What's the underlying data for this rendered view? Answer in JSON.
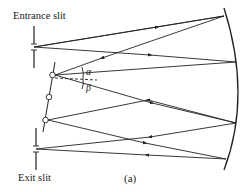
{
  "diagram": {
    "type": "Czerny-Turner monochromator optical layout",
    "labels": {
      "entrance_slit": "Entrance slit",
      "exit_slit": "Exit slit",
      "alpha": "α",
      "beta": "β",
      "caption": "(a)"
    },
    "components": [
      {
        "name": "entrance-slit",
        "x": 34,
        "y": 47
      },
      {
        "name": "exit-slit",
        "x": 36,
        "y": 148
      },
      {
        "name": "diffraction-grating",
        "pivots": [
          [
            52,
            75
          ],
          [
            49,
            97
          ],
          [
            46,
            120
          ]
        ]
      },
      {
        "name": "concave-mirror",
        "side": "right"
      }
    ],
    "colors": {
      "line": "#222222",
      "background": "#ffffff"
    }
  }
}
